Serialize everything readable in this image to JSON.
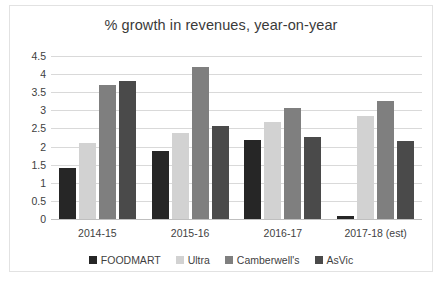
{
  "chart_data": {
    "type": "bar",
    "title": "% growth in revenues, year-on-year",
    "xlabel": "",
    "ylabel": "",
    "categories": [
      "2014-15",
      "2015-16",
      "2016-17",
      "2017-18 (est)"
    ],
    "series": [
      {
        "name": "FOODMART",
        "color": "#262626",
        "values": [
          1.4,
          1.89,
          2.18,
          0.07
        ]
      },
      {
        "name": "Ultra",
        "color": "#d2d2d2",
        "values": [
          2.1,
          2.38,
          2.67,
          2.85
        ]
      },
      {
        "name": "Camberwell's",
        "color": "#7f7f7f",
        "values": [
          3.7,
          4.19,
          3.06,
          3.26
        ]
      },
      {
        "name": "AsVic",
        "color": "#4a4a4a",
        "values": [
          3.8,
          2.58,
          2.27,
          2.16
        ]
      }
    ],
    "ylim": [
      0,
      4.5
    ],
    "yticks": [
      "0",
      "0.5",
      "1",
      "1.5",
      "2",
      "2.5",
      "3",
      "3.5",
      "4",
      "4.5"
    ],
    "ytick_values": [
      0,
      0.5,
      1,
      1.5,
      2,
      2.5,
      3,
      3.5,
      4,
      4.5
    ],
    "grid": true,
    "legend_position": "bottom"
  }
}
